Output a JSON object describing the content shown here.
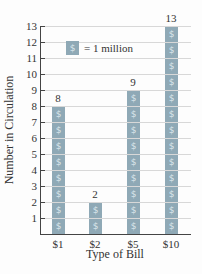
{
  "chart_data": {
    "type": "bar",
    "subtype": "pictograph",
    "title": "",
    "categories": [
      "$1",
      "$2",
      "$5",
      "$10"
    ],
    "values": [
      8,
      2,
      9,
      13
    ],
    "xlabel": "Type of Bill",
    "ylabel": "Number in Circulation",
    "ylim": [
      0,
      13
    ],
    "yticks": [
      1,
      2,
      3,
      4,
      5,
      6,
      7,
      8,
      9,
      10,
      11,
      12,
      13
    ],
    "grid": true,
    "legend": {
      "symbol": "$",
      "text": "= 1 million",
      "position": "upper-left-inside"
    },
    "unit_symbol": "$",
    "colors": {
      "symbol_fill": "#8fa9b6",
      "symbol_glyph": "#dce7ec",
      "grid": "#d8d8d8",
      "axis": "#444444"
    }
  }
}
